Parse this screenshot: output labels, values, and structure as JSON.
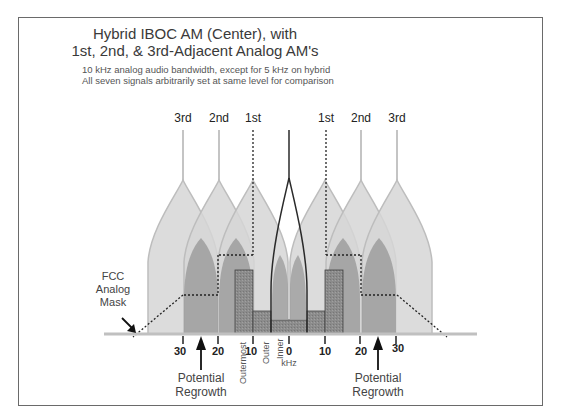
{
  "title": {
    "line1": "Hybrid IBOC AM (Center), with",
    "line2": "1st, 2nd, & 3rd-Adjacent Analog AM's"
  },
  "subtitle": {
    "line1": "10 kHz analog audio bandwidth, except for 5 kHz on hybrid",
    "line2": "All seven signals arbitrarily set at same level for comparison"
  },
  "carrier_labels": {
    "left_3rd": "3rd",
    "left_2nd": "2nd",
    "left_1st": "1st",
    "right_1st": "1st",
    "right_2nd": "2nd",
    "right_3rd": "3rd"
  },
  "mask_label": {
    "line1": "FCC",
    "line2": "Analog",
    "line3": "Mask"
  },
  "axis": {
    "ticks": [
      "30",
      "20",
      "10",
      "0",
      "10",
      "20",
      "30"
    ],
    "unit": "kHz",
    "sideband_labels": {
      "outermost": "Outermost",
      "outer": "Outer",
      "inner": "Inner"
    }
  },
  "annotations": {
    "left_regrowth": {
      "line1": "Potential",
      "line2": "Regrowth"
    },
    "right_regrowth": {
      "line1": "Potential",
      "line2": "Regrowth"
    }
  },
  "colors": {
    "envelope_light": "#d4d4d4",
    "envelope_edge": "#b8b8b8",
    "core_dark": "#9a9a9a",
    "digital_box": "#8a8a8a",
    "outline": "#2a2a2a",
    "mask": "#222222"
  }
}
